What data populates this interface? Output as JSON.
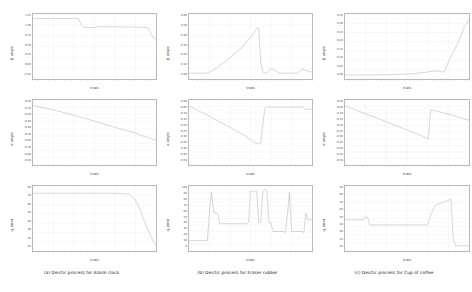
{
  "figure": {
    "layout": "3 columns x 3 rows of line plots",
    "xlabel": "trials",
    "row_labels": [
      "β angle",
      "α angle",
      "q_error"
    ]
  },
  "captions": [
    "(a) Deictic process for Alarm clock",
    "(b) Deictic process for Eraser rubber",
    "(c) Deictic process for Cup of coffee"
  ],
  "colors": {
    "line": "#8f8f8f",
    "frame": "#b9b9b9",
    "grid": "#e2e2e2",
    "text": "#222222",
    "background": "#ffffff"
  },
  "chart_data": [
    {
      "type": "line",
      "panel": "a-beta",
      "title": "(a) Deictic process for Alarm clock — β angle",
      "xlabel": "trials",
      "ylabel": "β angle",
      "xlim": [
        0,
        46
      ],
      "ylim": [
        -2.0,
        1.25
      ],
      "yticks": [
        "1.25",
        "1.00",
        "0.75",
        "0.50",
        "0.25",
        "0.00",
        "-0.25"
      ],
      "grid": true,
      "series": [
        {
          "name": "β",
          "x": [
            0,
            1,
            16,
            17,
            18,
            19,
            23,
            24,
            38,
            39,
            43,
            44,
            45,
            46
          ],
          "y": [
            1.02,
            1.03,
            1.03,
            1.03,
            0.72,
            0.58,
            0.57,
            0.62,
            0.6,
            0.59,
            0.57,
            0.3,
            0.06,
            0.02
          ]
        }
      ]
    },
    {
      "type": "line",
      "panel": "a-alpha",
      "title": "(a) Deictic process for Alarm clock — α angle",
      "xlabel": "trials",
      "ylabel": "α angle",
      "xlim": [
        0,
        46
      ],
      "ylim": [
        -0.95,
        0.02
      ],
      "yticks": [
        "0.00",
        "-0.10",
        "-0.20",
        "-0.30",
        "-0.40",
        "-0.50",
        "-0.60",
        "-0.70",
        "-0.80",
        "-0.90"
      ],
      "grid": true,
      "series": [
        {
          "name": "α",
          "x": [
            0,
            10,
            20,
            30,
            38,
            42,
            46
          ],
          "y": [
            -0.06,
            -0.15,
            -0.26,
            -0.38,
            -0.47,
            -0.53,
            -0.58
          ]
        }
      ]
    },
    {
      "type": "line",
      "panel": "a-qerror",
      "title": "(a) Deictic process for Alarm clock — q_error",
      "xlabel": "trials",
      "ylabel": "q_error",
      "xlim": [
        0,
        46
      ],
      "ylim": [
        0,
        90
      ],
      "yticks": [
        "80",
        "70",
        "60",
        "50",
        "40",
        "30",
        "20",
        "10"
      ],
      "grid": true,
      "series": [
        {
          "name": "q_error",
          "x": [
            0,
            30,
            36,
            38,
            40,
            42,
            44,
            46
          ],
          "y": [
            80,
            80,
            79,
            72,
            58,
            38,
            20,
            8
          ]
        }
      ]
    },
    {
      "type": "line",
      "panel": "b-beta",
      "title": "(b) Deictic process for Eraser rubber — β angle",
      "xlabel": "trials",
      "ylabel": "β angle",
      "xlim": [
        0,
        60
      ],
      "ylim": [
        -0.05,
        0.62
      ],
      "yticks": [
        "0.60",
        "0.50",
        "0.40",
        "0.30",
        "0.20",
        "0.10",
        "0.00"
      ],
      "grid": true,
      "series": [
        {
          "name": "β",
          "x": [
            0,
            8,
            10,
            14,
            20,
            26,
            30,
            32,
            33,
            34,
            35,
            36,
            38,
            40,
            42,
            44,
            46,
            50,
            53,
            55,
            57,
            60
          ],
          "y": [
            0.01,
            0.01,
            0.02,
            0.07,
            0.17,
            0.28,
            0.38,
            0.44,
            0.47,
            0.48,
            0.12,
            0.02,
            0.01,
            0.06,
            0.04,
            0.01,
            0.01,
            0.01,
            0.01,
            0.05,
            0.04,
            0.02
          ]
        }
      ]
    },
    {
      "type": "line",
      "panel": "b-alpha",
      "title": "(b) Deictic process for Eraser rubber — α angle",
      "xlabel": "trials",
      "ylabel": "α angle",
      "xlim": [
        0,
        60
      ],
      "ylim": [
        -0.62,
        0.02
      ],
      "yticks": [
        "0.00",
        "-0.05",
        "-0.10",
        "-0.15",
        "-0.20",
        "-0.25",
        "-0.30",
        "-0.35",
        "-0.40",
        "-0.45",
        "-0.50"
      ],
      "grid": true,
      "series": [
        {
          "name": "α",
          "x": [
            0,
            10,
            20,
            28,
            32,
            34,
            35,
            36,
            37,
            38,
            42,
            50,
            55,
            57,
            60
          ],
          "y": [
            -0.04,
            -0.14,
            -0.25,
            -0.34,
            -0.4,
            -0.41,
            -0.4,
            -0.22,
            -0.06,
            -0.05,
            -0.05,
            -0.05,
            -0.05,
            -0.07,
            -0.07
          ]
        }
      ]
    },
    {
      "type": "line",
      "panel": "b-qerror",
      "title": "(b) Deictic process for Eraser rubber — q_error",
      "xlabel": "trials",
      "ylabel": "q_error",
      "xlim": [
        0,
        60
      ],
      "ylim": [
        0,
        100
      ],
      "yticks": [
        "100",
        "90",
        "80",
        "70",
        "60",
        "50",
        "40",
        "30",
        "20",
        "10",
        "0"
      ],
      "grid": true,
      "series": [
        {
          "name": "q_error",
          "x": [
            0,
            9,
            10,
            11,
            12,
            13,
            14,
            15,
            28,
            29,
            30,
            33,
            34,
            35,
            36,
            37,
            38,
            39,
            40,
            41,
            46,
            47,
            48,
            49,
            50,
            55,
            56,
            57,
            58,
            60
          ],
          "y": [
            16,
            16,
            62,
            90,
            60,
            58,
            58,
            42,
            42,
            44,
            92,
            92,
            44,
            44,
            92,
            95,
            92,
            44,
            43,
            30,
            30,
            28,
            55,
            90,
            30,
            30,
            28,
            58,
            48,
            48
          ]
        }
      ]
    },
    {
      "type": "line",
      "panel": "c-beta",
      "title": "(c) Deictic process for Cup of coffee — β angle",
      "xlabel": "trials",
      "ylabel": "β angle",
      "xlim": [
        0,
        55
      ],
      "ylim": [
        -0.02,
        0.38
      ],
      "yticks": [
        "0.35",
        "0.30",
        "0.25",
        "0.20",
        "0.15",
        "0.10",
        "0.05",
        "0.00"
      ],
      "grid": true,
      "series": [
        {
          "name": "β",
          "x": [
            0,
            20,
            30,
            36,
            40,
            42,
            44,
            46,
            50,
            53,
            55
          ],
          "y": [
            0.004,
            0.006,
            0.012,
            0.022,
            0.03,
            0.026,
            0.022,
            0.09,
            0.2,
            0.3,
            0.345
          ]
        }
      ]
    },
    {
      "type": "line",
      "panel": "c-alpha",
      "title": "(c) Deictic process for Cup of coffee — α angle",
      "xlabel": "trials",
      "ylabel": "α angle",
      "xlim": [
        0,
        55
      ],
      "ylim": [
        -0.65,
        0.02
      ],
      "yticks": [
        "0.00",
        "-0.05",
        "-0.10",
        "-0.15",
        "-0.20",
        "-0.25",
        "-0.30",
        "-0.35",
        "-0.40",
        "-0.45",
        "-0.50"
      ],
      "grid": true,
      "series": [
        {
          "name": "α",
          "x": [
            0,
            10,
            20,
            30,
            36,
            37,
            38,
            40,
            48,
            55
          ],
          "y": [
            -0.04,
            -0.13,
            -0.22,
            -0.31,
            -0.37,
            -0.38,
            -0.08,
            -0.09,
            -0.14,
            -0.19
          ]
        }
      ]
    },
    {
      "type": "line",
      "panel": "c-qerror",
      "title": "(c) Deictic process for Cup of coffee — q_error",
      "xlabel": "trials",
      "ylabel": "q_error",
      "xlim": [
        0,
        55
      ],
      "ylim": [
        0,
        100
      ],
      "yticks": [
        "90",
        "80",
        "70",
        "60",
        "50",
        "40",
        "30",
        "20",
        "10"
      ],
      "grid": true,
      "series": [
        {
          "name": "q_error",
          "x": [
            0,
            8,
            9,
            10,
            11,
            36,
            37,
            38,
            40,
            44,
            46,
            47,
            48,
            49,
            55
          ],
          "y": [
            48,
            48,
            52,
            52,
            40,
            40,
            42,
            55,
            70,
            76,
            78,
            80,
            20,
            8,
            8
          ]
        }
      ]
    }
  ]
}
